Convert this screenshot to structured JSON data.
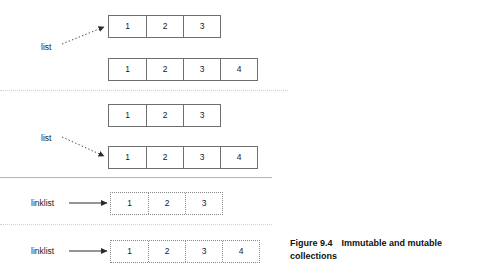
{
  "figure": {
    "caption_number": "Figure 9.4",
    "caption_text": "Immutable and mutable collections"
  },
  "diagram": {
    "type": "diagram",
    "panels": [
      {
        "id": "panel-1",
        "reference_label": "list",
        "reference_target": "row-1",
        "arrow_style": "dotted",
        "rows": [
          {
            "id": "row-1",
            "style": "solid",
            "cells": [
              "1",
              "2",
              "3"
            ]
          },
          {
            "id": "row-2",
            "style": "solid",
            "cells": [
              "1",
              "2",
              "3",
              "4"
            ]
          }
        ]
      },
      {
        "id": "panel-2",
        "reference_label": "list",
        "reference_target": "row-4",
        "arrow_style": "dotted",
        "rows": [
          {
            "id": "row-3",
            "style": "solid",
            "cells": [
              "1",
              "2",
              "3"
            ]
          },
          {
            "id": "row-4",
            "style": "solid",
            "cells": [
              "1",
              "2",
              "3",
              "4"
            ]
          }
        ]
      },
      {
        "id": "panel-3",
        "reference_label": "linklist",
        "reference_target": "row-5",
        "arrow_style": "solid",
        "rows": [
          {
            "id": "row-5",
            "style": "dotted",
            "cells": [
              "1",
              "2",
              "3"
            ]
          }
        ]
      },
      {
        "id": "panel-4",
        "reference_label": "linklist",
        "reference_target": "row-6",
        "arrow_style": "solid",
        "rows": [
          {
            "id": "row-6",
            "style": "dotted",
            "cells": [
              "1",
              "2",
              "3",
              "4"
            ]
          }
        ]
      }
    ],
    "colors": {
      "solid_border": "#6e6e6e",
      "dotted_border": "#8a8a8a",
      "text": "#1a1a1a",
      "divider_dotted": "#d2d2d2",
      "divider_solid": "#b4b4b4",
      "background": "#ffffff"
    }
  }
}
